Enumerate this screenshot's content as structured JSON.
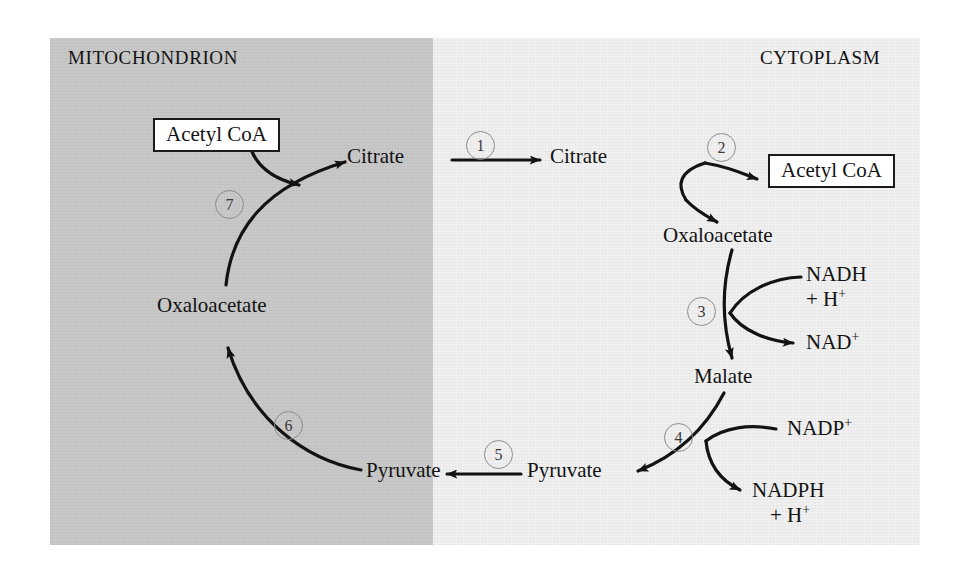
{
  "figure": {
    "type": "metabolic-pathway-diagram",
    "background": "#ffffff"
  },
  "compartments": [
    {
      "id": "mitochondrion",
      "label": "MITOCHONDRION",
      "fill": "#c9c9c9"
    },
    {
      "id": "cytoplasm",
      "label": "CYTOPLASM",
      "fill": "#f1f1f1"
    }
  ],
  "metabolites": [
    {
      "id": "acetyl-coa-mito",
      "label": "Acetyl CoA",
      "compartment": "mitochondrion",
      "boxed": true
    },
    {
      "id": "citrate-mito",
      "label": "Citrate",
      "compartment": "mitochondrion",
      "boxed": false
    },
    {
      "id": "citrate-cyto",
      "label": "Citrate",
      "compartment": "cytoplasm",
      "boxed": false
    },
    {
      "id": "acetyl-coa-cyto",
      "label": "Acetyl CoA",
      "compartment": "cytoplasm",
      "boxed": true
    },
    {
      "id": "oxaloacetate-cyto",
      "label": "Oxaloacetate",
      "compartment": "cytoplasm",
      "boxed": false
    },
    {
      "id": "malate-cyto",
      "label": "Malate",
      "compartment": "cytoplasm",
      "boxed": false
    },
    {
      "id": "pyruvate-cyto",
      "label": "Pyruvate",
      "compartment": "cytoplasm",
      "boxed": false
    },
    {
      "id": "pyruvate-mito",
      "label": "Pyruvate",
      "compartment": "mitochondrion",
      "boxed": false
    },
    {
      "id": "oxaloacetate-mito",
      "label": "Oxaloacetate",
      "compartment": "mitochondrion",
      "boxed": false
    }
  ],
  "cofactors": [
    {
      "id": "nadh",
      "line1": "NADH",
      "line2": "+ H",
      "line2_sup": "+",
      "role": "substrate",
      "step": 3
    },
    {
      "id": "nad-plus",
      "line1": "NAD",
      "line1_sup": "+",
      "line2": "",
      "role": "product",
      "step": 3
    },
    {
      "id": "nadp-plus",
      "line1": "NADP",
      "line1_sup": "+",
      "line2": "",
      "role": "substrate",
      "step": 4
    },
    {
      "id": "nadph",
      "line1": "NADPH",
      "line2": "+ H",
      "line2_sup": "+",
      "role": "product",
      "step": 4
    }
  ],
  "steps": [
    {
      "number": "1",
      "from": "citrate-mito",
      "to": "citrate-cyto",
      "description": "citrate transport out of mitochondrion"
    },
    {
      "number": "2",
      "from": "citrate-cyto",
      "to": "acetyl-coa-cyto + oxaloacetate-cyto",
      "description": "ATP-citrate lyase cleavage"
    },
    {
      "number": "3",
      "from": "oxaloacetate-cyto",
      "to": "malate-cyto",
      "description": "malate dehydrogenase, NADH to NAD+"
    },
    {
      "number": "4",
      "from": "malate-cyto",
      "to": "pyruvate-cyto",
      "description": "malic enzyme, NADP+ to NADPH"
    },
    {
      "number": "5",
      "from": "pyruvate-cyto",
      "to": "pyruvate-mito",
      "description": "pyruvate transport into mitochondrion"
    },
    {
      "number": "6",
      "from": "pyruvate-mito",
      "to": "oxaloacetate-mito",
      "description": "pyruvate carboxylase"
    },
    {
      "number": "7",
      "from": "oxaloacetate-mito + acetyl-coa-mito",
      "to": "citrate-mito",
      "description": "citrate synthase"
    }
  ],
  "style": {
    "stroke": "#131313",
    "badge_stroke": "#8c8c8c",
    "badge_text": "#3a3a3a",
    "text": "#131313"
  }
}
